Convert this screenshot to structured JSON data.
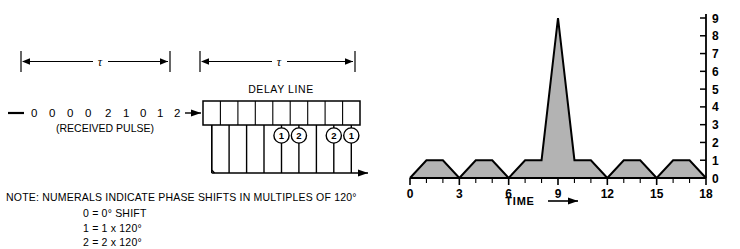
{
  "left_panel": {
    "tau_label_1": "τ",
    "tau_label_2": "τ",
    "delay_line_title": "DELAY LINE",
    "pulse_sequence": "0  0  0  0  2  1  0  1  2",
    "pulse_sequence_digits": [
      "0",
      "0",
      "0",
      "0",
      "2",
      "1",
      "0",
      "1",
      "2"
    ],
    "received_pulse_label": "(RECEIVED PULSE)",
    "tap_weights": [
      "",
      "",
      "",
      "",
      "1",
      "2",
      "",
      "2",
      "1"
    ],
    "tap_count": 9,
    "note_line": "NOTE: NUMERALS INDICATE PHASE SHIFTS IN MULTIPLES OF 120°",
    "legend": [
      "0  =  0° SHIFT",
      "1  =  1 x 120°",
      "2  =  2 x 120°"
    ]
  },
  "chart_data": {
    "type": "area",
    "title": "",
    "xlabel": "TIME",
    "ylabel": "",
    "xlim": [
      0,
      18
    ],
    "ylim": [
      0,
      9
    ],
    "grid": false,
    "legend": null,
    "x_major_ticks": [
      0,
      3,
      6,
      9,
      12,
      15,
      18
    ],
    "x_tick_labels": [
      "0",
      "3",
      "6",
      "9",
      "12",
      "15",
      "18"
    ],
    "x_minor_tick_step": 1,
    "y_ticks": [
      0,
      1,
      2,
      3,
      4,
      5,
      6,
      7,
      8,
      9
    ],
    "y_tick_labels": [
      "0",
      "1",
      "2",
      "3",
      "4",
      "5",
      "6",
      "7",
      "8",
      "9"
    ],
    "y_axis_position": "right",
    "x": [
      0,
      1,
      2,
      3,
      4,
      5,
      6,
      7,
      8,
      9,
      10,
      11,
      12,
      13,
      14,
      15,
      16,
      17,
      18
    ],
    "values": [
      0,
      1,
      1,
      0,
      1,
      1,
      0,
      1,
      1,
      9,
      1,
      1,
      0,
      1,
      1,
      0,
      1,
      1,
      0
    ],
    "peak_value": 9,
    "peak_time": 9,
    "fill_color": "#b3b3b3",
    "line_color": "#000000",
    "time_arrow": "→"
  }
}
